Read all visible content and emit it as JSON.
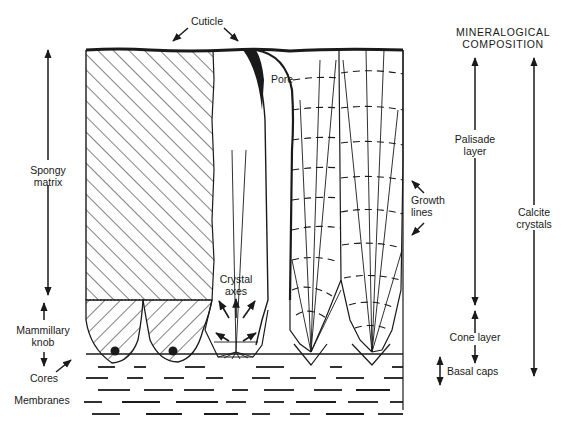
{
  "labels": {
    "cuticle": "Cuticle",
    "pore": "Pore",
    "spongy_matrix": [
      "Spongy",
      "matrix"
    ],
    "mammillary_knob": [
      "Mammillary",
      "knob"
    ],
    "cores": "Cores",
    "membranes": "Membranes",
    "crystal_axes": [
      "Crystal",
      "axes"
    ],
    "growth_lines": [
      "Growth",
      "lines"
    ]
  },
  "composition": {
    "heading": [
      "MINERALOGICAL",
      "COMPOSITION"
    ],
    "palisade_layer": [
      "Palisade",
      "layer"
    ],
    "cone_layer": "Cone layer",
    "basal_caps": "Basal caps",
    "calcite_crystals": [
      "Calcite",
      "crystals"
    ]
  },
  "colors": {
    "ink": "#1a1a1a",
    "background": "#ffffff"
  }
}
